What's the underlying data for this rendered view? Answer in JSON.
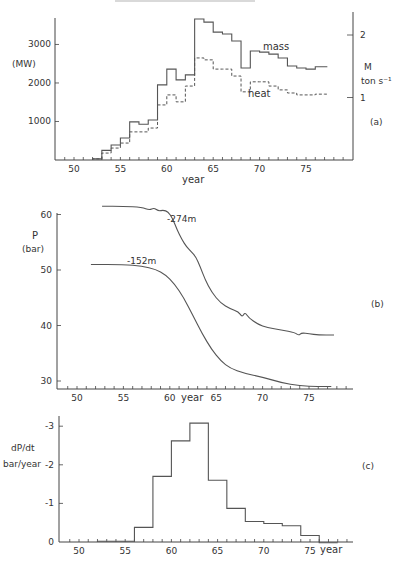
{
  "figure": {
    "panel_labels": [
      "(a)",
      "(b)",
      "(c)"
    ]
  },
  "chart_data": [
    {
      "type": "line",
      "subtype": "step",
      "panel": "(a)",
      "title": "",
      "xlabel": "year",
      "ylabel": "(MW)",
      "ylabel_right": "M ton s-1",
      "ylabel_right_lines": [
        "M",
        "ton s⁻¹"
      ],
      "xlim": [
        48,
        80
      ],
      "ylim": [
        0,
        3700
      ],
      "ylim_right": [
        0,
        2.55
      ],
      "x_ticks": [
        50,
        55,
        60,
        65,
        70,
        75
      ],
      "y_ticks": [
        1000,
        2000,
        3000
      ],
      "y_ticks_right": [
        1,
        2
      ],
      "grid": false,
      "x": [
        52,
        53,
        54,
        55,
        56,
        57,
        58,
        59,
        60,
        61,
        62,
        63,
        64,
        65,
        66,
        67,
        68,
        69,
        70,
        71,
        72,
        73,
        74,
        75,
        76,
        77
      ],
      "series": [
        {
          "name": "mass",
          "style": "solid",
          "values": [
            30,
            250,
            390,
            570,
            990,
            930,
            1040,
            1950,
            2360,
            2080,
            2210,
            3660,
            3580,
            3320,
            3270,
            3090,
            2390,
            2830,
            2800,
            2750,
            2650,
            2440,
            2390,
            2360,
            2420,
            2420
          ]
        },
        {
          "name": "heat",
          "style": "dashed",
          "values": [
            30,
            180,
            310,
            440,
            730,
            730,
            830,
            1430,
            1690,
            1510,
            1920,
            2650,
            2600,
            2360,
            2360,
            2180,
            1770,
            2030,
            2030,
            1920,
            1820,
            1740,
            1690,
            1690,
            1710,
            1710
          ]
        }
      ],
      "annotations": [
        "mass",
        "heat"
      ]
    },
    {
      "type": "line",
      "panel": "(b)",
      "title": "",
      "xlabel": "year",
      "ylabel": "P (bar)",
      "ylabel_lines": [
        "P",
        "(bar)"
      ],
      "xlim": [
        48,
        80
      ],
      "ylim": [
        28.5,
        62
      ],
      "x_ticks": [
        50,
        55,
        60,
        65,
        70,
        75
      ],
      "y_ticks": [
        30,
        40,
        50,
        60
      ],
      "grid": false,
      "series": [
        {
          "name": "-274m",
          "x": [
            52.7,
            55,
            57,
            57.8,
            58.3,
            58.8,
            59.3,
            59.8,
            60.3,
            60.8,
            61.3,
            61.8,
            62.3,
            62.8,
            63.3,
            63.8,
            64.5,
            65.5,
            66.5,
            67.4,
            67.8,
            68.1,
            68.5,
            69.5,
            70.5,
            72,
            73.5,
            73.9,
            74.2,
            75,
            76,
            77.7
          ],
          "values": [
            61.5,
            61.5,
            61.3,
            60.8,
            61.2,
            60.6,
            60.8,
            60.5,
            59.3,
            57.2,
            55.5,
            54.2,
            53.3,
            52.4,
            50.5,
            48.3,
            46,
            44,
            43,
            42.5,
            41.5,
            42.4,
            41.4,
            40.2,
            39.6,
            39.2,
            38.7,
            38.2,
            38.7,
            38.5,
            38.3,
            38.3
          ]
        },
        {
          "name": "-152m",
          "x": [
            51.5,
            55,
            57,
            58.5,
            59.5,
            60.5,
            61.5,
            62.5,
            63.5,
            64.5,
            65.5,
            66.5,
            68,
            70,
            72,
            74,
            76,
            77.4
          ],
          "values": [
            51,
            51,
            50.7,
            50.1,
            49.2,
            47.5,
            45,
            41.8,
            38.5,
            35.7,
            33.6,
            32.3,
            31.4,
            30.7,
            29.7,
            29.1,
            29,
            29
          ]
        }
      ],
      "annotations": [
        "-274m",
        "-152m"
      ]
    },
    {
      "type": "line",
      "subtype": "step",
      "panel": "(c)",
      "title": "",
      "xlabel": "year",
      "ylabel": "dP/dt bar/year",
      "ylabel_lines": [
        "dP/dt",
        "bar/year"
      ],
      "xlim": [
        48,
        80
      ],
      "ylim": [
        0,
        -3.3
      ],
      "x_ticks": [
        50,
        55,
        60,
        65,
        70,
        75
      ],
      "y_ticks": [
        0,
        -1,
        -2,
        -3
      ],
      "y_tick_labels": [
        "0",
        "-1",
        "-2",
        "-3"
      ],
      "grid": false,
      "bin_edges": [
        52,
        56,
        58,
        60,
        62,
        64,
        66,
        68,
        70,
        72,
        74,
        76,
        78
      ],
      "values": [
        -0.02,
        -0.38,
        -1.7,
        -2.62,
        -3.08,
        -1.6,
        -0.87,
        -0.53,
        -0.48,
        -0.42,
        -0.17,
        0.02
      ]
    }
  ]
}
